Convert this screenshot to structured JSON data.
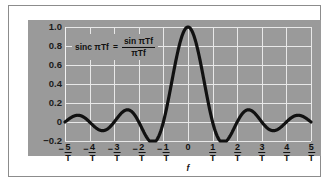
{
  "figure": {
    "background_color": "#9a9a9a",
    "grid_color": "#e8e8e8",
    "curve_color": "#111111",
    "page_color": "#ffffff"
  },
  "formula": {
    "lhs": "sinc πTf",
    "equals": "=",
    "numerator": "sin πTf",
    "denominator": "πTf"
  },
  "axes": {
    "xlabel": "f",
    "ylabel": "",
    "yticks": [
      "1.0",
      "0.8",
      "0.6",
      "0.4",
      "0.2",
      "0",
      "−0.2"
    ],
    "ytick_values": [
      1.0,
      0.8,
      0.6,
      0.4,
      0.2,
      0,
      -0.2
    ],
    "ylim": [
      -0.2,
      1.0
    ],
    "xlim": [
      -5,
      5
    ],
    "xtick_values": [
      -5,
      -4,
      -3,
      -2,
      -1,
      0,
      1,
      2,
      3,
      4,
      5
    ],
    "xticks": [
      {
        "sign": "−",
        "num": "5",
        "den": "T"
      },
      {
        "sign": "−",
        "num": "4",
        "den": "T"
      },
      {
        "sign": "−",
        "num": "3",
        "den": "T"
      },
      {
        "sign": "−",
        "num": "2",
        "den": "T"
      },
      {
        "sign": "−",
        "num": "1",
        "den": "T"
      },
      {
        "sign": "",
        "num": "0",
        "den": ""
      },
      {
        "sign": "",
        "num": "1",
        "den": "T"
      },
      {
        "sign": "",
        "num": "2",
        "den": "T"
      },
      {
        "sign": "",
        "num": "3",
        "den": "T"
      },
      {
        "sign": "",
        "num": "4",
        "den": "T"
      },
      {
        "sign": "",
        "num": "5",
        "den": "T"
      }
    ]
  },
  "chart_data": {
    "type": "line",
    "title": "",
    "subtitle": "",
    "xlabel": "f",
    "ylabel": "",
    "xlim": [
      -5,
      5
    ],
    "ylim": [
      -0.2,
      1.0
    ],
    "grid": true,
    "legend": null,
    "annotations": [
      {
        "text": "sinc πTf = sin πTf / πTf",
        "x": -3.4,
        "y": 0.82
      }
    ],
    "x_tick_labels": [
      "-5/T",
      "-4/T",
      "-3/T",
      "-2/T",
      "-1/T",
      "0",
      "1/T",
      "2/T",
      "3/T",
      "4/T",
      "5/T"
    ],
    "y_tick_labels": [
      "-0.2",
      "0",
      "0.2",
      "0.4",
      "0.6",
      "0.8",
      "1.0"
    ],
    "series": [
      {
        "name": "sinc(πTf)",
        "formula": "sin(pi*x)/(pi*x)",
        "color": "#111111",
        "x": [
          -5.0,
          -4.8,
          -4.6,
          -4.5,
          -4.4,
          -4.2,
          -4.0,
          -3.8,
          -3.6,
          -3.5,
          -3.4,
          -3.2,
          -3.0,
          -2.8,
          -2.6,
          -2.5,
          -2.4,
          -2.2,
          -2.0,
          -1.8,
          -1.6,
          -1.5,
          -1.4,
          -1.2,
          -1.0,
          -0.8,
          -0.6,
          -0.4,
          -0.2,
          0.0,
          0.2,
          0.4,
          0.6,
          0.8,
          1.0,
          1.2,
          1.4,
          1.5,
          1.6,
          1.8,
          2.0,
          2.2,
          2.4,
          2.5,
          2.6,
          2.8,
          3.0,
          3.2,
          3.4,
          3.5,
          3.6,
          3.8,
          4.0,
          4.2,
          4.4,
          4.5,
          4.6,
          4.8,
          5.0
        ],
        "y": [
          0.0,
          0.0389,
          0.0646,
          0.0707,
          0.0682,
          0.0445,
          0.0,
          -0.0489,
          -0.0818,
          -0.0909,
          -0.0878,
          -0.0584,
          0.0,
          0.0655,
          0.1119,
          0.1273,
          0.1238,
          0.0844,
          0.0,
          -0.1033,
          -0.189,
          -0.2122,
          -0.2092,
          -0.1514,
          0.0,
          0.2339,
          0.5046,
          0.7568,
          0.9355,
          1.0,
          0.9355,
          0.7568,
          0.5046,
          0.2339,
          0.0,
          -0.1514,
          -0.2092,
          -0.2122,
          -0.189,
          -0.1033,
          0.0,
          0.0844,
          0.1238,
          0.1273,
          0.1119,
          0.0655,
          0.0,
          -0.0584,
          -0.0878,
          -0.0909,
          -0.0818,
          -0.0489,
          0.0,
          0.0445,
          0.0682,
          0.0707,
          0.0646,
          0.0389,
          0.0
        ],
        "peak": {
          "x": 0,
          "y": 1.0
        },
        "zeros": [
          -5,
          -4,
          -3,
          -2,
          -1,
          1,
          2,
          3,
          4,
          5
        ]
      }
    ]
  }
}
